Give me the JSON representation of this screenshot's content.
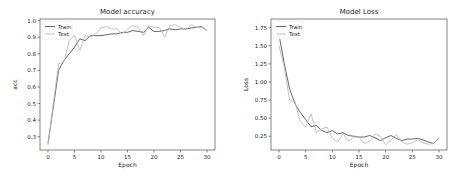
{
  "chart_data": [
    {
      "type": "line",
      "title": "Model accuracy",
      "xlabel": "Epoch",
      "ylabel": "acc",
      "xlim": [
        -1.5,
        31.5
      ],
      "ylim": [
        0.22,
        1.01
      ],
      "xticks": [
        0,
        5,
        10,
        15,
        20,
        25,
        30
      ],
      "yticks": [
        0.3,
        0.4,
        0.5,
        0.6,
        0.7,
        0.8,
        0.9,
        1.0
      ],
      "ytick_labels": [
        "0.3",
        "0.4",
        "0.5",
        "0.6",
        "0.7",
        "0.8",
        "0.9",
        "1.0"
      ],
      "grid": false,
      "legend_position": "upper left",
      "x": [
        0,
        1,
        2,
        3,
        4,
        5,
        6,
        7,
        8,
        9,
        10,
        11,
        12,
        13,
        14,
        15,
        16,
        17,
        18,
        19,
        20,
        21,
        22,
        23,
        24,
        25,
        26,
        27,
        28,
        29,
        30
      ],
      "series": [
        {
          "name": "Train",
          "color": "#555555",
          "values": [
            0.26,
            0.48,
            0.7,
            0.76,
            0.8,
            0.84,
            0.89,
            0.88,
            0.91,
            0.91,
            0.91,
            0.915,
            0.92,
            0.92,
            0.93,
            0.93,
            0.94,
            0.935,
            0.93,
            0.96,
            0.935,
            0.935,
            0.94,
            0.95,
            0.945,
            0.95,
            0.95,
            0.955,
            0.96,
            0.965,
            0.94
          ]
        },
        {
          "name": "Test",
          "color": "#bbbbbb",
          "values": [
            0.25,
            0.5,
            0.74,
            0.75,
            0.88,
            0.91,
            0.82,
            0.91,
            0.9,
            0.92,
            0.955,
            0.965,
            0.95,
            0.95,
            0.92,
            0.95,
            0.97,
            0.96,
            0.91,
            0.97,
            0.96,
            0.96,
            0.9,
            0.97,
            0.975,
            0.96,
            0.945,
            0.975,
            0.96,
            0.96,
            0.94
          ]
        }
      ]
    },
    {
      "type": "line",
      "title": "Model Loss",
      "xlabel": "Epoch",
      "ylabel": "Loss",
      "xlim": [
        -1.5,
        31.5
      ],
      "ylim": [
        0.06,
        1.87
      ],
      "xticks": [
        0,
        5,
        10,
        15,
        20,
        25,
        30
      ],
      "yticks": [
        0.25,
        0.5,
        0.75,
        1.0,
        1.25,
        1.5,
        1.75
      ],
      "ytick_labels": [
        "0.25",
        "0.50",
        "0.75",
        "1.00",
        "1.25",
        "1.50",
        "1.75"
      ],
      "grid": false,
      "legend_position": "upper left",
      "x": [
        0,
        1,
        2,
        3,
        4,
        5,
        6,
        7,
        8,
        9,
        10,
        11,
        12,
        13,
        14,
        15,
        16,
        17,
        18,
        19,
        20,
        21,
        22,
        23,
        24,
        25,
        26,
        27,
        28,
        29,
        30
      ],
      "series": [
        {
          "name": "Train",
          "color": "#555555",
          "values": [
            1.65,
            1.25,
            0.9,
            0.7,
            0.58,
            0.48,
            0.38,
            0.4,
            0.33,
            0.3,
            0.33,
            0.28,
            0.3,
            0.26,
            0.25,
            0.24,
            0.24,
            0.26,
            0.23,
            0.19,
            0.23,
            0.26,
            0.22,
            0.19,
            0.21,
            0.21,
            0.22,
            0.2,
            0.17,
            0.15,
            0.23
          ]
        },
        {
          "name": "Test",
          "color": "#bbbbbb",
          "values": [
            1.5,
            1.2,
            0.74,
            0.73,
            0.45,
            0.38,
            0.56,
            0.3,
            0.35,
            0.38,
            0.22,
            0.17,
            0.29,
            0.18,
            0.24,
            0.24,
            0.15,
            0.18,
            0.28,
            0.25,
            0.13,
            0.2,
            0.27,
            0.17,
            0.14,
            0.16,
            0.2,
            0.16,
            0.14,
            0.15,
            0.22
          ]
        }
      ]
    }
  ]
}
